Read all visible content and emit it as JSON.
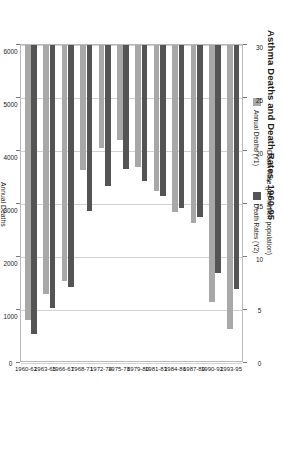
{
  "chart_data": {
    "type": "bar",
    "orientation": "horizontal",
    "title": "Asthma Deaths and Death Rates, 1960-95",
    "categories": [
      "1960-62",
      "1963-65",
      "1966-67",
      "1968-71",
      "1972-74",
      "1975-78",
      "1979-80",
      "1981-83",
      "1984-86",
      "1987-89",
      "1990-92",
      "1993-95"
    ],
    "series": [
      {
        "name": "Annual Deaths (Y1)",
        "axis": "bottom",
        "color": "#a8a8a8",
        "values": [
          5180,
          4700,
          4450,
          2350,
          1950,
          1800,
          2300,
          2750,
          3150,
          3350,
          4850,
          5350
        ]
      },
      {
        "name": "Death Rates (Y2)",
        "axis": "top",
        "color": "#545454",
        "values": [
          27.3,
          24.8,
          22.8,
          15.7,
          13.3,
          11.7,
          12.8,
          14.2,
          15.4,
          16.2,
          21.5,
          23.0
        ]
      }
    ],
    "x_top": {
      "label": "Death Rate (per million population)",
      "ticks": [
        30,
        25,
        20,
        15,
        10,
        5,
        0
      ],
      "min": 0,
      "max": 30,
      "reversed": true
    },
    "x_bottom": {
      "label": "Annual Deaths",
      "ticks": [
        6000,
        5000,
        4000,
        3000,
        2000,
        1000,
        0
      ],
      "min": 0,
      "max": 6000,
      "reversed": true
    },
    "legend": {
      "position": "top-left",
      "entries": [
        "Annual Deaths (Y1)",
        "Death Rates (Y2)"
      ]
    },
    "grid": true
  }
}
